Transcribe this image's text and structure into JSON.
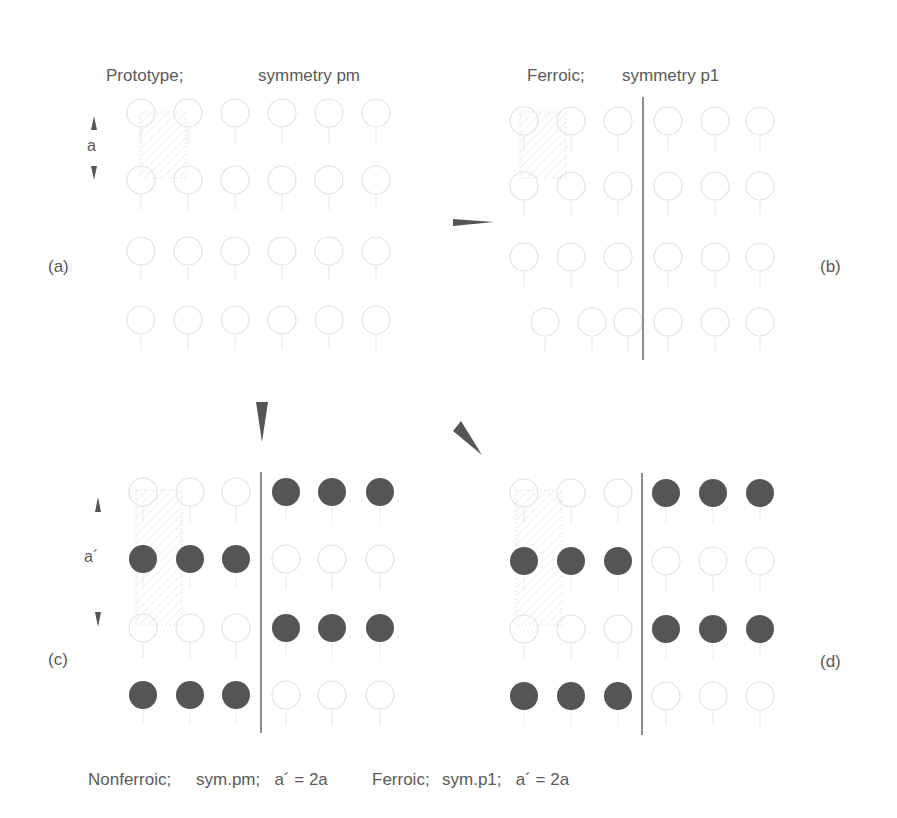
{
  "panels": {
    "a": {
      "tag": "(a)",
      "caption_left": "Prototype;",
      "caption_right": "symmetry pm",
      "dimension_label": "a"
    },
    "b": {
      "tag": "(b)",
      "caption_left": "Ferroic;",
      "caption_right": "symmetry p1"
    },
    "c": {
      "tag": "(c)",
      "caption_left": "Nonferroic;",
      "caption_right": "sym.pm;   a´ = 2a",
      "dimension_label": "a´"
    },
    "d": {
      "tag": "(d)",
      "caption_left": "Ferroic;",
      "caption_right": "sym.p1;   a´ = 2a"
    }
  },
  "colors": {
    "text": "#5a5a5a",
    "filled_atom": "#555555",
    "open_atom": "#e2e2e2",
    "domain_wall": "#666666",
    "arrow": "#555555"
  }
}
